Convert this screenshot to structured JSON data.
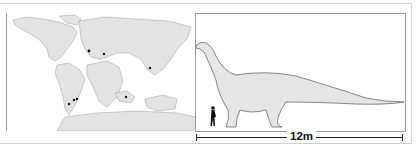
{
  "map": {
    "label": "Cretaceous period",
    "land_color": "#e3e3e3",
    "sea_color": "#ffffff",
    "fossil_sites": [
      {
        "region": "europe-west",
        "x": 82,
        "y": 38
      },
      {
        "region": "europe-east",
        "x": 97,
        "y": 41
      },
      {
        "region": "asia-southeast",
        "x": 143,
        "y": 55
      },
      {
        "region": "south-america-1",
        "x": 62,
        "y": 91
      },
      {
        "region": "south-america-2",
        "x": 67,
        "y": 87
      },
      {
        "region": "south-america-3",
        "x": 70,
        "y": 86
      },
      {
        "region": "madagascar-india",
        "x": 119,
        "y": 84
      }
    ]
  },
  "size_comparison": {
    "scale_label": "12m",
    "dino_fill": "#e6e6e6",
    "human_color": "#111111"
  }
}
